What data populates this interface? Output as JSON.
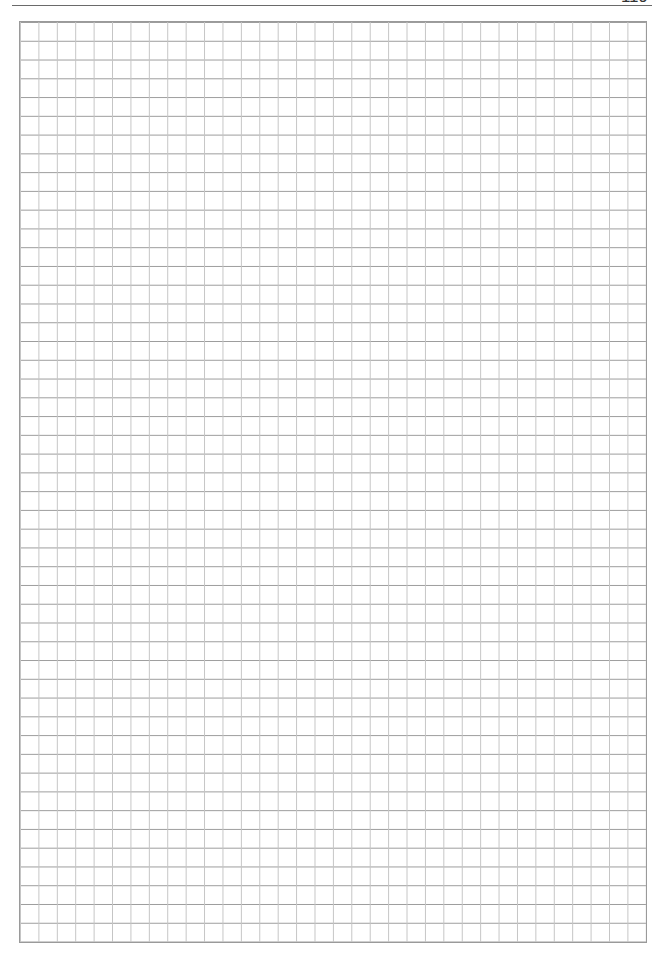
{
  "page": {
    "number": "119",
    "type": "graph-paper"
  },
  "grid": {
    "columns": 34,
    "rows": 49,
    "line_color_vertical": "#c4c4c4",
    "line_color_horizontal": "#9c9c9c",
    "border_color": "#9a9a9a"
  }
}
